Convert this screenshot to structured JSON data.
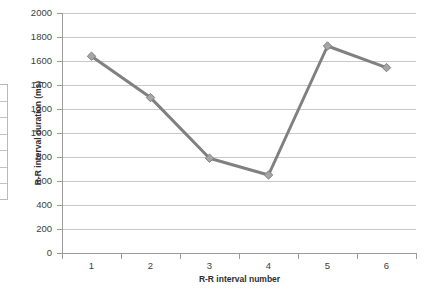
{
  "chart_data": {
    "type": "line",
    "title": "",
    "xlabel": "R-R interval number",
    "ylabel": "R-R interval duration (ms)",
    "categories": [
      "1",
      "2",
      "3",
      "4",
      "5",
      "6"
    ],
    "x": [
      1,
      2,
      3,
      4,
      5,
      6
    ],
    "values": [
      1640,
      1295,
      790,
      650,
      1725,
      1545
    ],
    "series": [
      {
        "name": "R-R interval duration",
        "values": [
          1640,
          1295,
          790,
          650,
          1725,
          1545
        ]
      }
    ],
    "xlim": [
      0.5,
      6.5
    ],
    "ylim": [
      0,
      2000
    ],
    "ytick_labels": [
      "0",
      "200",
      "400",
      "600",
      "800",
      "1000",
      "1200",
      "1400",
      "1600",
      "1800",
      "2000"
    ],
    "ytick_values": [
      0,
      200,
      400,
      600,
      800,
      1000,
      1200,
      1400,
      1600,
      1800,
      2000
    ],
    "xtick_labels": [
      "1",
      "2",
      "3",
      "4",
      "5",
      "6"
    ],
    "grid": "horizontal",
    "legend": "none",
    "line_color": "#808080",
    "marker_color": "#a6a6a6",
    "marker_shape": "diamond",
    "gridline_color": "#c8c8c8",
    "axis_color": "#9a9a9a",
    "background": "#ffffff"
  },
  "table_fragment": {
    "name": "clipped-table",
    "row_count": 7
  }
}
